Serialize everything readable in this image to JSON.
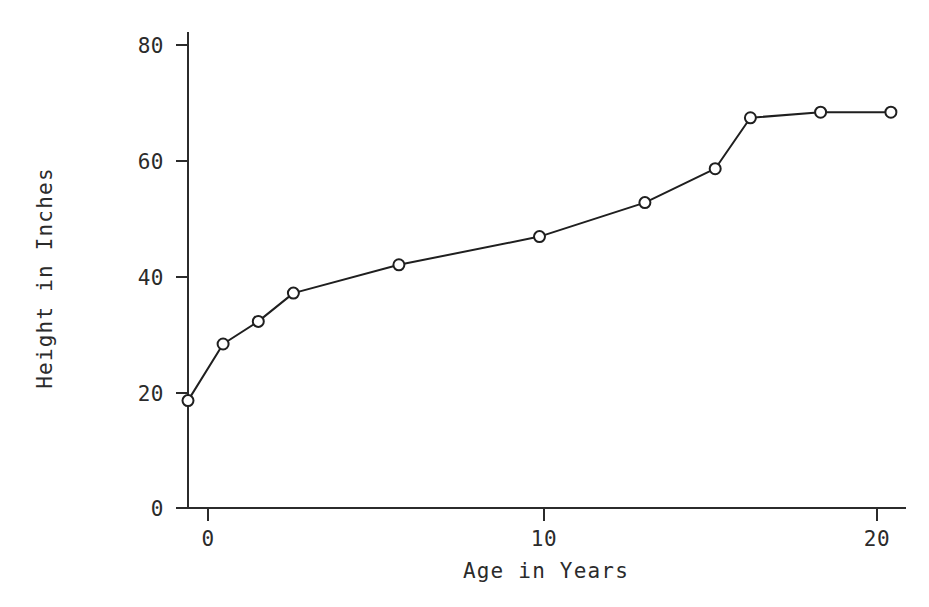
{
  "chart_data": {
    "type": "line",
    "title": "",
    "xlabel": "Age in Years",
    "ylabel": "Height in Inches",
    "x": [
      0,
      1,
      2,
      3,
      6,
      10,
      13,
      15,
      16,
      18,
      20
    ],
    "values": [
      19,
      29,
      33,
      38,
      43,
      48,
      54,
      60,
      69,
      70,
      70
    ],
    "series": [
      {
        "name": "Height",
        "points": [
          {
            "x": 0,
            "y": 19
          },
          {
            "x": 1,
            "y": 29
          },
          {
            "x": 2,
            "y": 33
          },
          {
            "x": 3,
            "y": 38
          },
          {
            "x": 6,
            "y": 43
          },
          {
            "x": 10,
            "y": 48
          },
          {
            "x": 13,
            "y": 54
          },
          {
            "x": 15,
            "y": 60
          },
          {
            "x": 16,
            "y": 69
          },
          {
            "x": 18,
            "y": 70
          },
          {
            "x": 20,
            "y": 70
          }
        ]
      }
    ],
    "xlim": [
      0,
      20.4
    ],
    "ylim": [
      0,
      84
    ],
    "xticks": [
      0,
      10,
      20
    ],
    "xticklabels": [
      "0",
      "10",
      "20"
    ],
    "yticks": [
      0,
      20,
      40,
      60,
      80
    ],
    "yticklabels": [
      "0",
      "20",
      "40",
      "60",
      "80"
    ],
    "grid": false,
    "legend": null,
    "marker": "circle-open",
    "line_color": "#1f1f1f",
    "marker_face_color": "#ffffff",
    "axis_color": "#2b2b2b",
    "background_color": "#ffffff"
  }
}
